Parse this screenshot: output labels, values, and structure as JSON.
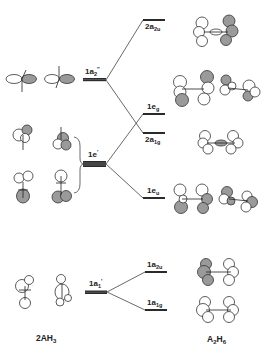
{
  "diagram": {
    "type": "molecular-orbital-correlation-diagram",
    "left_fragment_label": {
      "base": "2AH",
      "sub": "3"
    },
    "right_molecule_label": {
      "base_a": "A",
      "sub_a": "2",
      "base_b": "H",
      "sub_b": "6"
    },
    "colors": {
      "line": "#333333",
      "level": "#333333",
      "lobe_shaded": "#9a9a9a",
      "lobe_open": "#ffffff",
      "background": "#ffffff"
    },
    "fragment_levels": [
      {
        "id": "1a2pp",
        "base": "1a",
        "sub": "2",
        "sup": "″",
        "degenerate": true,
        "y": 79
      },
      {
        "id": "1ep",
        "base": "1e",
        "sub": "",
        "sup": "′",
        "degenerate": true,
        "y": 164
      },
      {
        "id": "1a1p",
        "base": "1a",
        "sub": "1",
        "sup": "′",
        "degenerate": true,
        "y": 292
      }
    ],
    "molecule_levels": [
      {
        "id": "2a2u",
        "base": "2a",
        "sub": "2u",
        "y": 20,
        "from": "1a2pp"
      },
      {
        "id": "1eg",
        "base": "1e",
        "sub": "g",
        "y": 114,
        "from": "1ep"
      },
      {
        "id": "2a1g",
        "base": "2a",
        "sub": "1g",
        "y": 133,
        "from": "1a2pp"
      },
      {
        "id": "1eu",
        "base": "1e",
        "sub": "u",
        "y": 198,
        "from": "1ep"
      },
      {
        "id": "1a2u",
        "base": "1a",
        "sub": "2u",
        "y": 272,
        "from": "1a1p"
      },
      {
        "id": "1a1g",
        "base": "1a",
        "sub": "1g",
        "y": 310,
        "from": "1a1p"
      }
    ]
  }
}
